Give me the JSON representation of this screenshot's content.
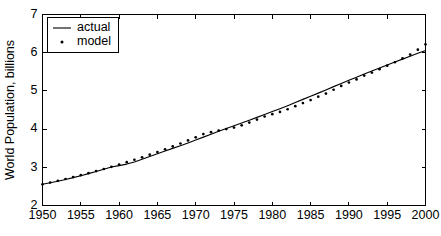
{
  "chart_data": {
    "type": "line",
    "title": "",
    "xlabel": "",
    "ylabel": "World Population, billions",
    "xlim": [
      1950,
      2000
    ],
    "ylim": [
      2,
      7
    ],
    "grid": false,
    "legend_position": "top-left",
    "xticks": [
      1950,
      1955,
      1960,
      1965,
      1970,
      1975,
      1980,
      1985,
      1990,
      1995,
      2000
    ],
    "xtick_labels": [
      "1950",
      "1955",
      "1960",
      "1965",
      "1970",
      "1975",
      "1980",
      "1985",
      "1990",
      "1995",
      "2000"
    ],
    "yticks": [
      2,
      3,
      4,
      5,
      6,
      7
    ],
    "ytick_labels": [
      "2",
      "3",
      "4",
      "5",
      "6",
      "7"
    ],
    "x": [
      1950,
      1951,
      1952,
      1953,
      1954,
      1955,
      1956,
      1957,
      1958,
      1959,
      1960,
      1961,
      1962,
      1963,
      1964,
      1965,
      1966,
      1967,
      1968,
      1969,
      1970,
      1971,
      1972,
      1973,
      1974,
      1975,
      1976,
      1977,
      1978,
      1979,
      1980,
      1981,
      1982,
      1983,
      1984,
      1985,
      1986,
      1987,
      1988,
      1989,
      1990,
      1991,
      1992,
      1993,
      1994,
      1995,
      1996,
      1997,
      1998,
      1999,
      2000
    ],
    "series": [
      {
        "name": "actual",
        "style": "line",
        "values": [
          2.557,
          2.594,
          2.636,
          2.682,
          2.73,
          2.781,
          2.834,
          2.89,
          2.947,
          3.006,
          3.043,
          3.084,
          3.14,
          3.21,
          3.285,
          3.355,
          3.425,
          3.495,
          3.565,
          3.638,
          3.712,
          3.79,
          3.867,
          3.943,
          4.017,
          4.09,
          4.162,
          4.234,
          4.307,
          4.382,
          4.458,
          4.535,
          4.614,
          4.696,
          4.778,
          4.86,
          4.942,
          5.026,
          5.112,
          5.196,
          5.279,
          5.36,
          5.44,
          5.52,
          5.599,
          5.677,
          5.755,
          5.832,
          5.908,
          5.983,
          6.06
        ]
      },
      {
        "name": "model",
        "style": "dots",
        "values": [
          2.555,
          2.6,
          2.646,
          2.694,
          2.743,
          2.794,
          2.846,
          2.9,
          2.956,
          3.013,
          3.072,
          3.134,
          3.197,
          3.262,
          3.33,
          3.399,
          3.471,
          3.546,
          3.623,
          3.703,
          3.785,
          3.871,
          3.919,
          3.96,
          4.0,
          4.04,
          4.1,
          4.17,
          4.25,
          4.33,
          4.39,
          4.45,
          4.52,
          4.6,
          4.68,
          4.76,
          4.85,
          4.93,
          5.03,
          5.13,
          5.22,
          5.3,
          5.4,
          5.48,
          5.57,
          5.66,
          5.75,
          5.85,
          5.95,
          6.08,
          6.22
        ]
      }
    ],
    "legend": [
      {
        "label": "actual",
        "marker": "line"
      },
      {
        "label": "model",
        "marker": "dot"
      }
    ]
  }
}
